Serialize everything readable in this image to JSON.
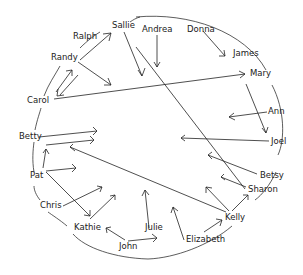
{
  "diagram": {
    "type": "sociogram",
    "colors": {
      "ink": "#222222",
      "background": "#ffffff"
    },
    "nodes": [
      {
        "id": "sallie",
        "label": "Sallie",
        "x": 114,
        "y": 26
      },
      {
        "id": "andrea",
        "label": "Andrea",
        "x": 141,
        "y": 31
      },
      {
        "id": "donna",
        "label": "Donna",
        "x": 188,
        "y": 31
      },
      {
        "id": "ralph",
        "label": "Ralph",
        "x": 73,
        "y": 38
      },
      {
        "id": "james",
        "label": "James",
        "x": 233,
        "y": 55
      },
      {
        "id": "randy",
        "label": "Randy",
        "x": 51,
        "y": 59
      },
      {
        "id": "mary",
        "label": "Mary",
        "x": 250,
        "y": 75
      },
      {
        "id": "carol",
        "label": "Carol",
        "x": 27,
        "y": 102
      },
      {
        "id": "ann",
        "label": "Ann",
        "x": 269,
        "y": 113
      },
      {
        "id": "joel",
        "label": "Joel",
        "x": 271,
        "y": 143
      },
      {
        "id": "betty",
        "label": "Betty",
        "x": 19,
        "y": 139
      },
      {
        "id": "betsy",
        "label": "Betsy",
        "x": 259,
        "y": 177
      },
      {
        "id": "pat",
        "label": "Pat",
        "x": 30,
        "y": 178
      },
      {
        "id": "sharon",
        "label": "Sharon",
        "x": 248,
        "y": 191
      },
      {
        "id": "chris",
        "label": "Chris",
        "x": 40,
        "y": 207
      },
      {
        "id": "kelly",
        "label": "Kelly",
        "x": 225,
        "y": 219
      },
      {
        "id": "kathie",
        "label": "Kathie",
        "x": 74,
        "y": 229
      },
      {
        "id": "julie",
        "label": "Julie",
        "x": 145,
        "y": 229
      },
      {
        "id": "john",
        "label": "John",
        "x": 119,
        "y": 248
      },
      {
        "id": "elizabeth",
        "label": "Elizabeth",
        "x": 186,
        "y": 241
      }
    ]
  }
}
